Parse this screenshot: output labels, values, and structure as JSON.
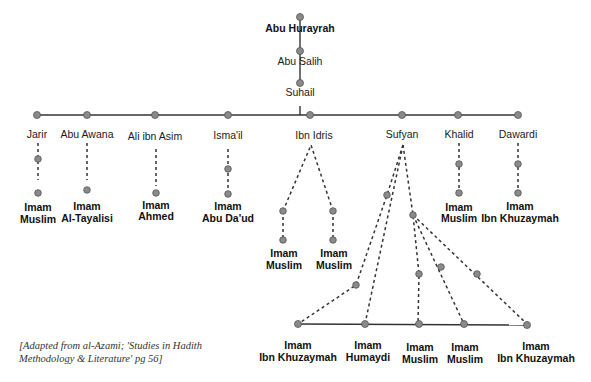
{
  "diagram": {
    "title_chain": [
      {
        "name": "Abu Hurayrah",
        "bold": true
      },
      {
        "name": "Abu Salih",
        "bold": false
      },
      {
        "name": "Suhail",
        "bold": false
      }
    ],
    "students_of_suhail": [
      {
        "name": "Jarir"
      },
      {
        "name": "Abu Awana"
      },
      {
        "name": "Ali ibn Asim"
      },
      {
        "name": "Isma'il"
      },
      {
        "name": "Ibn Idris"
      },
      {
        "name": "Sufyan"
      },
      {
        "name": "Khalid"
      },
      {
        "name": "Dawardi"
      }
    ],
    "collectors_row1": {
      "jarir": [
        "Imam",
        "Muslim"
      ],
      "abu_awana": [
        "Imam",
        "Al-Tayalisi"
      ],
      "ali_ibn_asim": [
        "Imam",
        "Ahmed"
      ],
      "ismail": [
        "Imam",
        "Abu Da'ud"
      ],
      "ibn_idris_a": [
        "Imam",
        "Muslim"
      ],
      "ibn_idris_b": [
        "Imam",
        "Muslim"
      ],
      "khalid": [
        "Imam",
        "Muslim"
      ],
      "dawardi": [
        "Imam",
        "Ibn Khuzaymah"
      ]
    },
    "collectors_sufyan": [
      [
        "Imam",
        "Ibn Khuzaymah"
      ],
      [
        "Imam",
        "Humaydi"
      ],
      [
        "Imam",
        "Muslim"
      ],
      [
        "Imam",
        "Muslim"
      ],
      [
        "Imam",
        "Ibn Khuzaymah"
      ]
    ],
    "caption_line1": "[Adapted from al-Azami; 'Studies in Hadith",
    "caption_line2": "Methodology & Literature' pg 56]"
  }
}
